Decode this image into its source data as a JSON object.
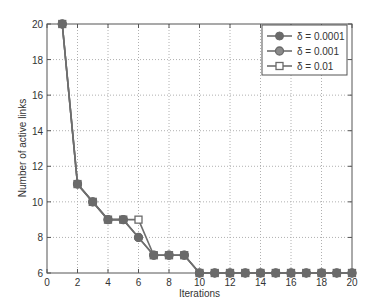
{
  "chart_data": {
    "type": "line",
    "title": "",
    "xlabel": "Iterations",
    "ylabel": "Number of active links",
    "xlim": [
      0,
      20
    ],
    "ylim": [
      6,
      20
    ],
    "xticks": [
      0,
      2,
      4,
      6,
      8,
      10,
      12,
      14,
      16,
      18,
      20
    ],
    "yticks": [
      6,
      8,
      10,
      12,
      14,
      16,
      18,
      20
    ],
    "grid": true,
    "legend_position": "upper right",
    "x": [
      1,
      2,
      3,
      4,
      5,
      6,
      7,
      8,
      9,
      10,
      11,
      12,
      13,
      14,
      15,
      16,
      17,
      18,
      19,
      20
    ],
    "series": [
      {
        "name": "δ = 0.0001",
        "marker": "filled-circle",
        "values": [
          20,
          11,
          10,
          9,
          9,
          8,
          7,
          7,
          7,
          6,
          6,
          6,
          6,
          6,
          6,
          6,
          6,
          6,
          6,
          6
        ]
      },
      {
        "name": "δ = 0.001",
        "marker": "circle",
        "values": [
          20,
          11,
          10,
          9,
          9,
          8,
          7,
          7,
          7,
          6,
          6,
          6,
          6,
          6,
          6,
          6,
          6,
          6,
          6,
          6
        ]
      },
      {
        "name": "δ = 0.01",
        "marker": "square",
        "values": [
          20,
          11,
          10,
          9,
          9,
          9,
          7,
          7,
          7,
          6,
          6,
          6,
          6,
          6,
          6,
          6,
          6,
          6,
          6,
          6
        ]
      }
    ],
    "colors": {
      "line": "#6e6e6e",
      "marker": "#6a6a6a",
      "axis": "#555555",
      "grid": "#b0b0b0"
    }
  }
}
